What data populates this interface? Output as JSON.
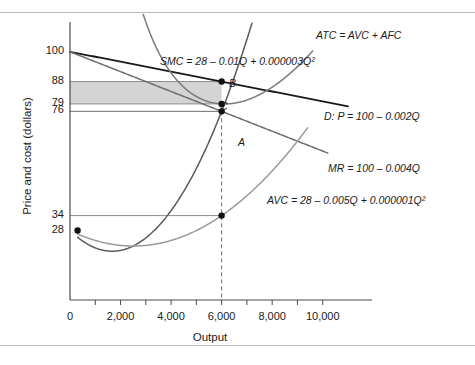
{
  "chart_data": {
    "type": "line",
    "title": "",
    "xlabel": "Output",
    "ylabel": "Price and cost (dollars)",
    "xlim": [
      0,
      11000
    ],
    "ylim": [
      0,
      112
    ],
    "grid": false,
    "legend_position": "inline-curve-labels",
    "x_ticks": [
      "0",
      "2,000",
      "4,000",
      "6,000",
      "8,000",
      "10,000"
    ],
    "x_tick_values": [
      0,
      2000,
      4000,
      6000,
      8000,
      10000
    ],
    "x_minor_tick_values": [
      1000,
      3000,
      5000,
      7000,
      9000
    ],
    "y_ticks": [
      "100",
      "88",
      "79",
      "76",
      "34",
      "28"
    ],
    "y_tick_values": [
      100,
      88,
      79,
      76,
      34,
      28
    ],
    "series": [
      {
        "name": "D",
        "label": "D: P = 100 – 0.002Q",
        "equation": "P = 100 - 0.002Q",
        "color": "#1a1a1a",
        "type": "linear",
        "intercept": 100,
        "slope": -0.002,
        "x_range": [
          0,
          11000
        ]
      },
      {
        "name": "MR",
        "label": "MR = 100 – 0.004Q",
        "equation": "MR = 100 - 0.004Q",
        "color": "#6e6e6e",
        "type": "linear",
        "intercept": 100,
        "slope": -0.004,
        "x_range": [
          0,
          10200
        ]
      },
      {
        "name": "SMC",
        "label": "SMC = 28 – 0.01Q + 0.000003Q²",
        "equation": "SMC = 28 - 0.01Q + 0.000003Q^2",
        "color": "#5a5a5a",
        "type": "quadratic",
        "a": 28,
        "b": -0.01,
        "c": 3e-06,
        "x_range": [
          300,
          7200
        ]
      },
      {
        "name": "AVC",
        "label": "AVC = 28 – 0.005Q + 0.000001Q²",
        "equation": "AVC = 28 - 0.005Q + 0.000001Q^2",
        "color": "#9a9a9a",
        "type": "quadratic",
        "a": 28,
        "b": -0.005,
        "c": 1e-06,
        "x_range": [
          300,
          9400
        ]
      },
      {
        "name": "ATC",
        "label": "ATC = AVC + AFC",
        "equation": "ATC = AVC + AFC",
        "color": "#7a7a7a",
        "type": "atc",
        "a": 28,
        "b": -0.005,
        "c": 1e-06,
        "fixed_cost": 270000,
        "x_range": [
          2900,
          9600
        ]
      }
    ],
    "points": [
      {
        "label": "A",
        "x": 6000,
        "y": 76,
        "note": "MR = SMC quantity at demand-derived marginal revenue"
      },
      {
        "label": "B",
        "x": 6000,
        "y": 88,
        "note": "price on demand curve"
      },
      {
        "label": "C",
        "x": 6000,
        "y": 79,
        "note": "average total cost"
      },
      {
        "label": "",
        "x": 6000,
        "y": 34,
        "note": "average variable cost at Q = 6,000"
      },
      {
        "label": "",
        "x": 300,
        "y": 28,
        "note": "intercept of SMC and AVC"
      }
    ],
    "shaded_region": {
      "name": "economic-profit-area",
      "x_from": 0,
      "x_to": 6000,
      "y_from": 79,
      "y_to": 88,
      "color": "#d4d4d4"
    },
    "reference_lines": [
      {
        "orientation": "vertical",
        "value": 6000,
        "style": "dashed",
        "color": "#6e6e6e"
      },
      {
        "orientation": "horizontal",
        "value": 88,
        "style": "solid",
        "color": "#8a8a8a"
      },
      {
        "orientation": "horizontal",
        "value": 79,
        "style": "solid",
        "color": "#8a8a8a"
      },
      {
        "orientation": "horizontal",
        "value": 76,
        "style": "solid",
        "color": "#6e6e6e"
      },
      {
        "orientation": "horizontal",
        "value": 34,
        "style": "solid",
        "color": "#8a8a8a"
      }
    ],
    "curve_label_positions": [
      {
        "name": "ATC",
        "x_px": 316,
        "y_px": 29
      },
      {
        "name": "SMC",
        "x_px": 160,
        "y_px": 55
      },
      {
        "name": "D",
        "x_px": 324,
        "y_px": 110
      },
      {
        "name": "MR",
        "x_px": 328,
        "y_px": 162
      },
      {
        "name": "AVC",
        "x_px": 267,
        "y_px": 194
      }
    ],
    "point_label_positions": [
      {
        "name": "A",
        "x_px": 238,
        "y_px": 136
      },
      {
        "name": "B",
        "x_px": 229,
        "y_px": 77
      },
      {
        "name": "C",
        "x_px": 220,
        "y_px": 100
      }
    ]
  }
}
